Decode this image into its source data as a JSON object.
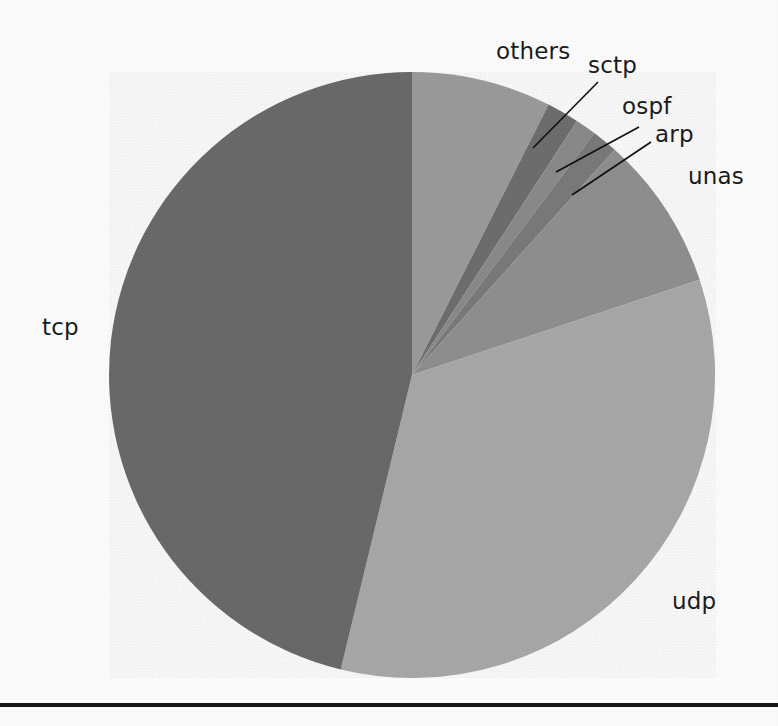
{
  "figure": {
    "title": "",
    "background_color": "#fdfdfd",
    "width": 778,
    "height": 726
  },
  "baseline_rule": {
    "name": "bottom-horizontal-rule",
    "color": "#15171a",
    "y": 703,
    "thickness": 4
  },
  "geometry": {
    "center_x": 412,
    "center_y": 375,
    "radius": 303,
    "start_angle_deg": 0
  },
  "labels": {
    "tcp": "tcp",
    "udp": "udp",
    "unas": "unas",
    "others": "others",
    "sctp": "sctp",
    "ospf": "ospf",
    "arp": "arp"
  },
  "chart_data": {
    "type": "pie",
    "title": "",
    "xlabel": "",
    "ylabel": "",
    "legend_position": "none",
    "grid": false,
    "start_angle_deg": 90,
    "direction": "clockwise",
    "categories": [
      "others",
      "sctp",
      "ospf",
      "arp",
      "unas",
      "udp",
      "tcp"
    ],
    "values": [
      7.4,
      1.7,
      1.1,
      1.4,
      8.3,
      33.9,
      46.2
    ],
    "units": "percent",
    "angles_deg": [
      26.8,
      6.2,
      4.0,
      5.0,
      29.7,
      121.9,
      166.4
    ],
    "colors": [
      "#9b9b9b",
      "#6e6e6e",
      "#8a8a8a",
      "#7a7a7a",
      "#8f8f8f",
      "#a8a8a8",
      "#6b6b6b"
    ],
    "slices": [
      {
        "label": "others",
        "value": 7.4,
        "start_deg": 0.0,
        "end_deg": 26.8,
        "color": "#9b9b9b",
        "label_type": "outside"
      },
      {
        "label": "sctp",
        "value": 1.7,
        "start_deg": 26.8,
        "end_deg": 33.0,
        "color": "#6e6e6e",
        "label_type": "leader"
      },
      {
        "label": "ospf",
        "value": 1.1,
        "start_deg": 33.0,
        "end_deg": 37.0,
        "color": "#8a8a8a",
        "label_type": "leader"
      },
      {
        "label": "arp",
        "value": 1.4,
        "start_deg": 37.0,
        "end_deg": 42.0,
        "color": "#7a7a7a",
        "label_type": "leader"
      },
      {
        "label": "unas",
        "value": 8.3,
        "start_deg": 42.0,
        "end_deg": 71.7,
        "color": "#8f8f8f",
        "label_type": "outside"
      },
      {
        "label": "udp",
        "value": 33.9,
        "start_deg": 71.7,
        "end_deg": 193.6,
        "color": "#a8a8a8",
        "label_type": "outside"
      },
      {
        "label": "tcp",
        "value": 46.2,
        "start_deg": 193.6,
        "end_deg": 360.0,
        "color": "#6b6b6b",
        "label_type": "outside"
      }
    ],
    "leader_lines": [
      {
        "label": "sctp",
        "from_x": 533,
        "from_y": 148,
        "to_x": 598,
        "to_y": 82
      },
      {
        "label": "ospf",
        "from_x": 556,
        "from_y": 172,
        "to_x": 639,
        "to_y": 127
      },
      {
        "label": "arp",
        "from_x": 572,
        "from_y": 195,
        "to_x": 651,
        "to_y": 142
      }
    ],
    "label_positions": [
      {
        "label": "others",
        "x": 496,
        "y": 40
      },
      {
        "label": "sctp",
        "x": 588,
        "y": 54
      },
      {
        "label": "ospf",
        "x": 622,
        "y": 95
      },
      {
        "label": "arp",
        "x": 655,
        "y": 123
      },
      {
        "label": "unas",
        "x": 688,
        "y": 165
      },
      {
        "label": "udp",
        "x": 672,
        "y": 590
      },
      {
        "label": "tcp",
        "x": 42,
        "y": 316
      }
    ]
  }
}
